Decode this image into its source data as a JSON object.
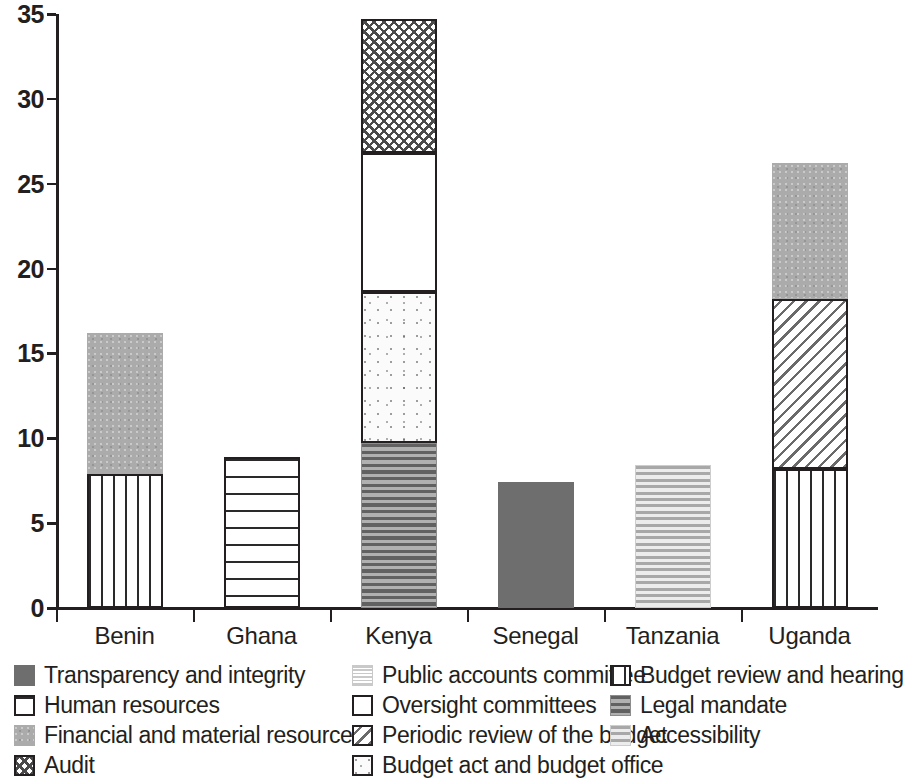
{
  "chart_data": {
    "type": "bar",
    "subtype": "stacked-bar",
    "title": "",
    "xlabel": "",
    "ylabel": "",
    "ylim": [
      0,
      35
    ],
    "ytick_values": [
      0,
      5,
      10,
      15,
      20,
      25,
      30,
      35
    ],
    "ytick_labels": [
      "0",
      "5",
      "10",
      "15",
      "20",
      "25",
      "30",
      "35"
    ],
    "grid": false,
    "legend_position": "bottom",
    "categories": [
      "Benin",
      "Ghana",
      "Kenya",
      "Senegal",
      "Tanzania",
      "Uganda"
    ],
    "series": [
      {
        "name": "Transparency and integrity",
        "key": "transparency",
        "pattern": "solid-dark-grey",
        "values": [
          0,
          0,
          0,
          7.4,
          0,
          0
        ]
      },
      {
        "name": "Human resources",
        "key": "humanres",
        "pattern": "horizontal-rules-on-white",
        "values": [
          0,
          8.9,
          0,
          0,
          0,
          0
        ]
      },
      {
        "name": "Financial and material resources",
        "key": "financial",
        "pattern": "medium-grey-noise",
        "values": [
          8.3,
          0,
          0,
          0,
          0,
          8.0
        ]
      },
      {
        "name": "Audit",
        "key": "audit",
        "pattern": "crosshatch",
        "values": [
          0,
          0,
          7.9,
          0,
          0,
          0
        ]
      },
      {
        "name": "Public accounts committee",
        "key": "pac",
        "pattern": "fine-light-horizontal",
        "values": [
          0,
          0,
          0,
          0,
          0,
          0
        ]
      },
      {
        "name": "Oversight committees",
        "key": "oversight",
        "pattern": "white-outline",
        "values": [
          0,
          0,
          8.2,
          0,
          0,
          0
        ]
      },
      {
        "name": "Periodic review of the budget",
        "key": "periodic",
        "pattern": "diagonal-hatch",
        "values": [
          0,
          0,
          0,
          0,
          0,
          10.0
        ]
      },
      {
        "name": "Budget act and budget office",
        "key": "budgetact",
        "pattern": "light-speckle",
        "values": [
          0,
          0,
          8.9,
          0,
          0,
          0
        ]
      },
      {
        "name": "Budget review and hearing",
        "key": "budgetreview",
        "pattern": "vertical-bars",
        "values": [
          7.9,
          0,
          0,
          0,
          0,
          8.2
        ]
      },
      {
        "name": "Legal mandate",
        "key": "legal",
        "pattern": "dense-dark-horizontal",
        "values": [
          0,
          0,
          9.7,
          0,
          0,
          0
        ]
      },
      {
        "name": "Accessibility",
        "key": "accessibility",
        "pattern": "light-horizontal-stripes",
        "values": [
          0,
          0,
          0,
          0,
          8.4,
          0
        ]
      }
    ],
    "totals": [
      16.2,
      8.9,
      34.7,
      7.4,
      8.4,
      26.2
    ],
    "bars": [
      {
        "category": "Benin",
        "total": 16.2,
        "stack": [
          {
            "series": "Budget review and hearing",
            "key": "budgetreview",
            "value": 7.9,
            "from": 0,
            "to": 7.9
          },
          {
            "series": "Financial and material resources",
            "key": "financial",
            "value": 8.3,
            "from": 7.9,
            "to": 16.2
          }
        ]
      },
      {
        "category": "Ghana",
        "total": 8.9,
        "stack": [
          {
            "series": "Human resources",
            "key": "humanres",
            "value": 8.9,
            "from": 0,
            "to": 8.9
          }
        ]
      },
      {
        "category": "Kenya",
        "total": 34.7,
        "stack": [
          {
            "series": "Legal mandate",
            "key": "legal",
            "value": 9.7,
            "from": 0,
            "to": 9.7
          },
          {
            "series": "Budget act and budget office",
            "key": "budgetact",
            "value": 8.9,
            "from": 9.7,
            "to": 18.6
          },
          {
            "series": "Oversight committees",
            "key": "oversight",
            "value": 8.2,
            "from": 18.6,
            "to": 26.8
          },
          {
            "series": "Audit",
            "key": "audit",
            "value": 7.9,
            "from": 26.8,
            "to": 34.7
          }
        ]
      },
      {
        "category": "Senegal",
        "total": 7.4,
        "stack": [
          {
            "series": "Transparency and integrity",
            "key": "transparency",
            "value": 7.4,
            "from": 0,
            "to": 7.4
          }
        ]
      },
      {
        "category": "Tanzania",
        "total": 8.4,
        "stack": [
          {
            "series": "Accessibility",
            "key": "accessibility",
            "value": 8.4,
            "from": 0,
            "to": 8.4
          }
        ]
      },
      {
        "category": "Uganda",
        "total": 26.2,
        "stack": [
          {
            "series": "Budget review and hearing",
            "key": "budgetreview",
            "value": 8.2,
            "from": 0,
            "to": 8.2
          },
          {
            "series": "Periodic review of the budget",
            "key": "periodic",
            "value": 10.0,
            "from": 8.2,
            "to": 18.2
          },
          {
            "series": "Financial and material resources",
            "key": "financial",
            "value": 8.0,
            "from": 18.2,
            "to": 26.2
          }
        ]
      }
    ]
  },
  "axis": {
    "y_labels": [
      "35",
      "30",
      "25",
      "20",
      "15",
      "10",
      "5",
      "0"
    ],
    "x_labels": [
      "Benin",
      "Ghana",
      "Kenya",
      "Senegal",
      "Tanzania",
      "Uganda"
    ]
  },
  "legend": {
    "columns": [
      {
        "items": [
          {
            "label": "Transparency and integrity",
            "pattern": "transparency"
          },
          {
            "label": "Human resources",
            "pattern": "humanres"
          },
          {
            "label": "Financial and material resources",
            "pattern": "financial"
          },
          {
            "label": "Audit",
            "pattern": "audit"
          }
        ]
      },
      {
        "items": [
          {
            "label": "Public accounts committee",
            "pattern": "pac"
          },
          {
            "label": "Oversight committees",
            "pattern": "oversight"
          },
          {
            "label": "Periodic review of the budget",
            "pattern": "periodic"
          },
          {
            "label": "Budget act and budget office",
            "pattern": "budgetact"
          }
        ]
      },
      {
        "items": [
          {
            "label": "Budget review and hearing",
            "pattern": "budgetreview"
          },
          {
            "label": "Legal mandate",
            "pattern": "legal"
          },
          {
            "label": "Accessibility",
            "pattern": "accessibility"
          }
        ]
      }
    ]
  },
  "colors": {
    "axis": "#231f20",
    "text": "#231f20",
    "transparency": "#6e6e6e",
    "financial": "#ababab",
    "financial_light": "#d6d6d6",
    "legal": "#8d8d8d",
    "accessibility": "#d2d2d2",
    "background": "#ffffff"
  }
}
